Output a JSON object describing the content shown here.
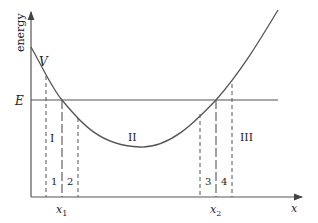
{
  "diagram": {
    "y_axis_label": "energy",
    "x_axis_label": "x",
    "curve_label": "V",
    "energy_level_label": "E",
    "turning_points": [
      {
        "label": "x",
        "subscript": "1"
      },
      {
        "label": "x",
        "subscript": "2"
      }
    ],
    "regions": [
      "I",
      "II",
      "III"
    ],
    "strips": [
      "1",
      "2",
      "3",
      "4"
    ],
    "colors": {
      "line": "#555555",
      "text": "#222222",
      "background": "#ffffff"
    }
  }
}
